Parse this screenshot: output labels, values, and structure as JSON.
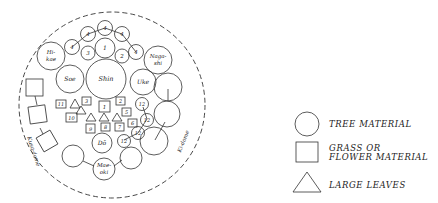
{
  "diagram": {
    "boundary_labels": {
      "left": "Kusa-dome",
      "right": "Ki-dome"
    },
    "main_elements": {
      "shin": "Shin",
      "soe": "Soe",
      "uke": "Uke",
      "hikae_1": "Hi-",
      "hikae_2": "kae",
      "nagashi_1": "Naga-",
      "nagashi_2": "shi",
      "do": "Dō",
      "maeoki_1": "Mae-",
      "maeoki_2": "oki"
    },
    "numbered_circles": {
      "c1": "1",
      "c2": "2",
      "c3": "3",
      "top4a": "4",
      "top4b": "4",
      "top4c": "4",
      "top4d": "4",
      "top4e": "4",
      "r12a": "12",
      "r12b": "12",
      "r12c": "12",
      "r12d": "12",
      "r12e": "12"
    },
    "numbered_squares": {
      "s1": "1",
      "s2": "2",
      "s3": "3",
      "s5": "5",
      "s6": "6",
      "s7": "7",
      "s8": "8",
      "s9": "9",
      "s10": "10",
      "s11": "11"
    }
  },
  "legend": {
    "items": [
      {
        "shape": "circle",
        "label": "TREE MATERIAL"
      },
      {
        "shape": "square",
        "label_line1": "GRASS OR",
        "label_line2": "FLOWER MATERIAL"
      },
      {
        "shape": "triangle",
        "label": "LARGE LEAVES"
      }
    ]
  }
}
